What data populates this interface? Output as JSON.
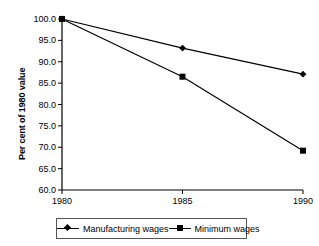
{
  "chart_data": {
    "type": "line",
    "title": "",
    "xlabel": "",
    "ylabel": "Per cent of 1980 value",
    "x": [
      1980,
      1985,
      1990
    ],
    "categories": [
      "1980",
      "1985",
      "1990"
    ],
    "series": [
      {
        "name": "Manufacturing wages",
        "marker": "diamond",
        "values": [
          100.0,
          93.2,
          87.1
        ]
      },
      {
        "name": "Minimum wages",
        "marker": "square",
        "values": [
          100.0,
          86.5,
          69.2
        ]
      }
    ],
    "ylim": [
      60.0,
      100.0
    ],
    "xlim": [
      1980,
      1990
    ],
    "y_ticks": [
      60.0,
      65.0,
      70.0,
      75.0,
      80.0,
      85.0,
      90.0,
      95.0,
      100.0
    ],
    "y_tick_labels": [
      "60.0",
      "65.0",
      "70.0",
      "75.0",
      "80.0",
      "85.0",
      "90.0",
      "95.0",
      "100.0"
    ],
    "x_ticks": [
      1980,
      1985,
      1990
    ],
    "x_tick_labels": [
      "1980",
      "1985",
      "1990"
    ],
    "grid": false,
    "legend_position": "bottom",
    "line_color": "#000000",
    "axis_color": "#000000",
    "background_color": "#ffffff"
  },
  "axes": {
    "y_title": "Per cent of 1980 value"
  },
  "legend": {
    "entries": [
      {
        "label": "Manufacturing wages",
        "marker": "diamond"
      },
      {
        "label": "Minimum wages",
        "marker": "square"
      }
    ]
  }
}
